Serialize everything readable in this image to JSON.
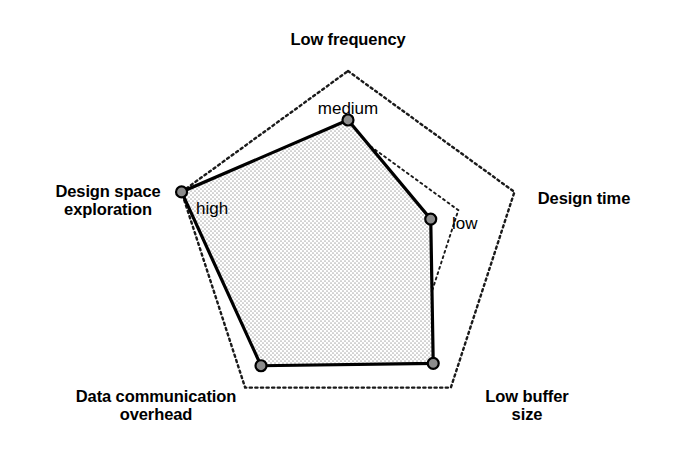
{
  "chart_data": {
    "type": "radar",
    "title": "",
    "categories": [
      "Low frequency",
      "Design time",
      "Low buffer size",
      "Data communication overhead",
      "Design space exploration"
    ],
    "value_labels": [
      "medium",
      "low",
      "",
      "",
      "high"
    ],
    "series": [
      {
        "name": "",
        "values": [
          0.72,
          0.5,
          0.83,
          0.85,
          1.0
        ],
        "value_text": [
          "medium",
          "low",
          "",
          "",
          "high"
        ]
      }
    ],
    "scale": {
      "min": 0,
      "max": 1.0,
      "rings": [
        1.0,
        0.66,
        0.4
      ],
      "ring_style": "dotted"
    },
    "grid": "on",
    "legend": "none",
    "xlabel": "",
    "ylabel": "",
    "colors": {
      "background": "#ffffff",
      "grid": "#1a1a1a",
      "series_line": "#000000",
      "series_fill": "#d9d9d9",
      "marker_fill": "#8c8c8c",
      "marker_stroke": "#000000",
      "text": "#000000"
    }
  },
  "axes": [
    {
      "id": "low-frequency",
      "label": "Low frequency",
      "value": "medium",
      "label_pos": {
        "x": 348,
        "y": 30,
        "align": "center"
      },
      "value_pos": {
        "x": 348,
        "y": 100,
        "align": "center"
      }
    },
    {
      "id": "design-time",
      "label": "Design time",
      "value": "low",
      "label_pos": {
        "x": 584,
        "y": 189,
        "align": "center"
      },
      "value_pos": {
        "x": 452,
        "y": 215,
        "align": "left"
      }
    },
    {
      "id": "low-buffer-size",
      "label": "Low buffer\nsize",
      "value": "",
      "label_pos": {
        "x": 527,
        "y": 387,
        "align": "center"
      },
      "value_pos": {
        "x": 0,
        "y": 0,
        "align": "center"
      }
    },
    {
      "id": "data-communication-overhead",
      "label": "Data communication\noverhead",
      "value": "",
      "label_pos": {
        "x": 156,
        "y": 387,
        "align": "center"
      },
      "value_pos": {
        "x": 0,
        "y": 0,
        "align": "center"
      }
    },
    {
      "id": "design-space-exploration",
      "label": "Design space\nexploration",
      "value": "high",
      "label_pos": {
        "x": 108,
        "y": 182,
        "align": "center"
      },
      "value_pos": {
        "x": 196,
        "y": 200,
        "align": "left"
      }
    }
  ],
  "geometry": {
    "center": {
      "x": 348,
      "y": 246
    },
    "outer_radius": 175,
    "angles_deg": [
      -90,
      -18,
      54,
      126,
      198
    ],
    "data_radii": [
      126,
      87,
      145,
      148,
      175
    ],
    "ring_radii": [
      175,
      116,
      70
    ],
    "marker_radius": 5.5
  }
}
